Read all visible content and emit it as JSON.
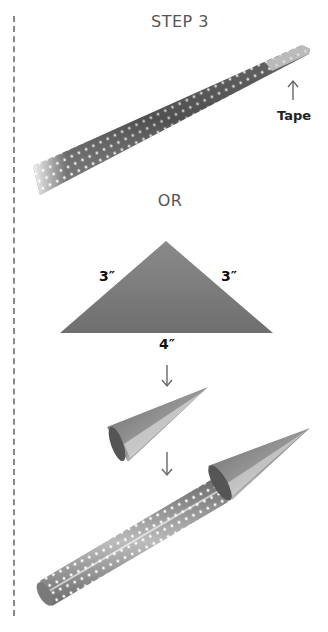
{
  "title": "STEP 3",
  "labels": {
    "tape": "Tape",
    "or": "OR",
    "side_left": "3″",
    "side_right": "3″",
    "base": "4″"
  },
  "colors": {
    "background": "#ffffff",
    "metal_dark": "#5e5e5e",
    "metal_mid": "#8c8c8c",
    "metal_light": "#d9d9d9",
    "text": "#111111",
    "dashed_line": "#8a8a8a"
  },
  "icons": [
    "up-arrow-icon",
    "down-arrow-icon",
    "down-arrow-icon"
  ]
}
